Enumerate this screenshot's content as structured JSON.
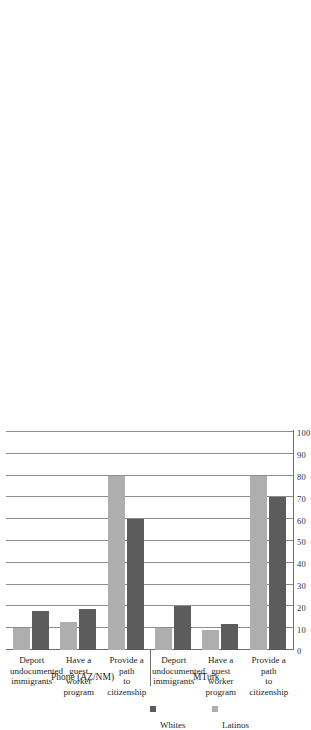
{
  "chart_data": {
    "type": "bar",
    "orientation": "horizontal",
    "title": "",
    "subtitle": "",
    "xlabel": "",
    "ylabel": "",
    "xlim": [
      0,
      100
    ],
    "grid": true,
    "gridlines_axis": "value",
    "legend_position": "right",
    "tick_labels": [
      "0",
      "10",
      "20",
      "30",
      "40",
      "50",
      "60",
      "70",
      "80",
      "90",
      "100"
    ],
    "tick_values": [
      0,
      10,
      20,
      30,
      40,
      50,
      60,
      70,
      80,
      90,
      100
    ],
    "series": [
      {
        "name": "Whites",
        "color": "#5c5c5c",
        "values": [
          18,
          19,
          60,
          20,
          12,
          70
        ]
      },
      {
        "name": "Latinos",
        "color": "#aeaeae",
        "values": [
          10,
          13,
          80,
          10,
          9,
          80
        ]
      }
    ],
    "categories": [
      "Deport\nundocumented\nimmigrants",
      "Have a guest\nworker program",
      "Provide a path\nto citizenship",
      "Deport\nundocumented\nimmigrants",
      "Have a guest\nworker program",
      "Provide a path\nto citizenship"
    ],
    "groups": [
      {
        "label": "Phone (AZ/NM)",
        "categories": [
          0,
          1,
          2
        ]
      },
      {
        "label": "MTurk",
        "categories": [
          3,
          4,
          5
        ]
      }
    ],
    "legend": [
      {
        "label": "Whites",
        "color": "#5c5c5c"
      },
      {
        "label": "Latinos",
        "color": "#aeaeae"
      }
    ]
  },
  "axis": {
    "ticks": [
      {
        "label": "0"
      },
      {
        "label": "10"
      },
      {
        "label": "20"
      },
      {
        "label": "30"
      },
      {
        "label": "40"
      },
      {
        "label": "50"
      },
      {
        "label": "60"
      },
      {
        "label": "70"
      },
      {
        "label": "80"
      },
      {
        "label": "90"
      },
      {
        "label": "100"
      }
    ]
  },
  "categories": [
    {
      "label": "Deport\nundocumented\nimmigrants"
    },
    {
      "label": "Have a guest\nworker program"
    },
    {
      "label": "Provide a path\nto citizenship"
    },
    {
      "label": "Deport\nundocumented\nimmigrants"
    },
    {
      "label": "Have a guest\nworker program"
    },
    {
      "label": "Provide a path\nto citizenship"
    }
  ],
  "groups": [
    {
      "label": "Phone (AZ/NM)"
    },
    {
      "label": "MTurk"
    }
  ],
  "legend": [
    {
      "label": "Whites"
    },
    {
      "label": "Latinos"
    }
  ]
}
